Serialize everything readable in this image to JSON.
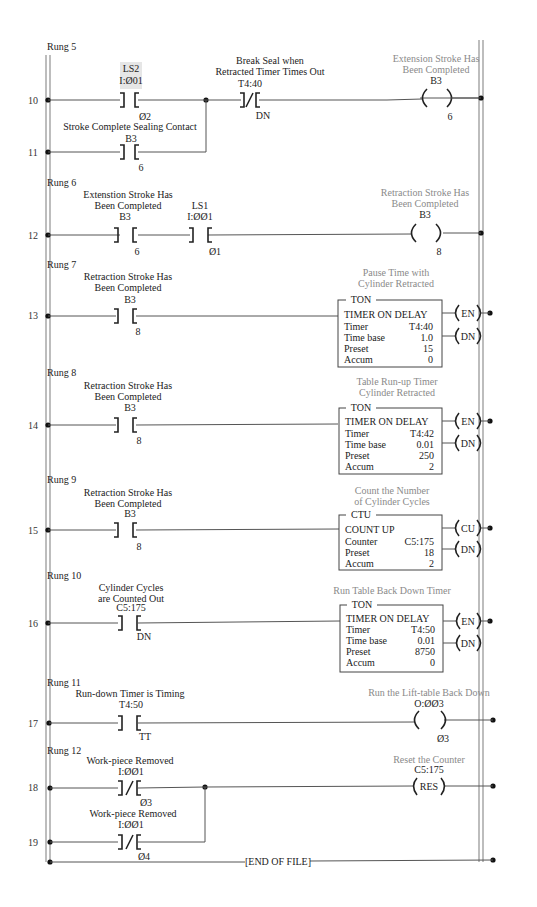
{
  "colors": {
    "line": "#555555",
    "rail": "#9a9a9a",
    "comment_gray": "#8a8a8a",
    "highlight_box": "#e6e6e6",
    "text": "#222222"
  },
  "rungs": [
    {
      "label": "Rung 5",
      "lines": [
        "10",
        "11"
      ],
      "instructions": [
        {
          "type": "XIC",
          "tag_line1": "LS2",
          "tag_line2": "I:Ø01",
          "bit": "Ø2",
          "highlighted": true
        },
        {
          "type": "XIO",
          "comment": [
            "Break Seal when",
            "Retracted Timer Times Out"
          ],
          "address": "T4:40",
          "bit": "DN"
        },
        {
          "type": "OTE",
          "comment": [
            "Extension Stroke Has",
            "Been Completed"
          ],
          "address": "B3",
          "bit": "6"
        }
      ],
      "branch": {
        "type": "XIC",
        "comment": [
          "Stroke Complete Sealing Contact"
        ],
        "address": "B3",
        "bit": "6"
      }
    },
    {
      "label": "Rung 6",
      "lines": [
        "12"
      ],
      "instructions": [
        {
          "type": "XIC",
          "comment": [
            "Extenstion Stroke Has",
            "Been Completed"
          ],
          "address": "B3",
          "bit": "6"
        },
        {
          "type": "XIC",
          "tag_line1": "LS1",
          "tag_line2": "I:ØØ1",
          "bit": "Ø1"
        },
        {
          "type": "OTE",
          "comment": [
            "Retraction Stroke Has",
            "Been Completed"
          ],
          "address": "B3",
          "bit": "8"
        }
      ]
    },
    {
      "label": "Rung 7",
      "lines": [
        "13"
      ],
      "instructions": [
        {
          "type": "XIC",
          "comment": [
            "Retraction Stroke Has",
            "Been Completed"
          ],
          "address": "B3",
          "bit": "8"
        },
        {
          "type": "TON",
          "comment": [
            "Pause Time with",
            "Cylinder Retracted"
          ],
          "block_label": "TON",
          "title": "TIMER ON DELAY",
          "rows": [
            [
              "Timer",
              "T4:40"
            ],
            [
              "Time base",
              "1.0"
            ],
            [
              "Preset",
              "15"
            ],
            [
              "Accum",
              "0"
            ]
          ],
          "outputs": [
            "EN",
            "DN"
          ]
        }
      ]
    },
    {
      "label": "Rung 8",
      "lines": [
        "14"
      ],
      "instructions": [
        {
          "type": "XIC",
          "comment": [
            "Retraction Stroke Has",
            "Been Completed"
          ],
          "address": "B3",
          "bit": "8"
        },
        {
          "type": "TON",
          "comment": [
            "Table Run-up Timer",
            "Cylinder Retracted"
          ],
          "block_label": "TON",
          "title": "TIMER ON DELAY",
          "rows": [
            [
              "Timer",
              "T4:42"
            ],
            [
              "Time base",
              "0.01"
            ],
            [
              "Preset",
              "250"
            ],
            [
              "Accum",
              "2"
            ]
          ],
          "outputs": [
            "EN",
            "DN"
          ]
        }
      ]
    },
    {
      "label": "Rung 9",
      "lines": [
        "15"
      ],
      "instructions": [
        {
          "type": "XIC",
          "comment": [
            "Retraction Stroke Has",
            "Been Completed"
          ],
          "address": "B3",
          "bit": "8"
        },
        {
          "type": "CTU",
          "comment": [
            "Count the Number",
            "of Cylinder Cycles"
          ],
          "block_label": "CTU",
          "title": "COUNT UP",
          "rows": [
            [
              "Counter",
              "C5:175"
            ],
            [
              "Preset",
              "18"
            ],
            [
              "Accum",
              "2"
            ]
          ],
          "outputs": [
            "CU",
            "DN"
          ]
        }
      ]
    },
    {
      "label": "Rung 10",
      "lines": [
        "16"
      ],
      "instructions": [
        {
          "type": "XIC",
          "comment": [
            "Cylinder Cycles",
            "are Counted Out"
          ],
          "address": "C5:175",
          "bit": "DN"
        },
        {
          "type": "TON",
          "comment": [
            "Run Table Back Down Timer"
          ],
          "block_label": "TON",
          "title": "TIMER ON DELAY",
          "rows": [
            [
              "Timer",
              "T4:50"
            ],
            [
              "Time base",
              "0.01"
            ],
            [
              "Preset",
              "8750"
            ],
            [
              "Accum",
              "0"
            ]
          ],
          "outputs": [
            "EN",
            "DN"
          ]
        }
      ]
    },
    {
      "label": "Rung 11",
      "lines": [
        "17"
      ],
      "instructions": [
        {
          "type": "XIC",
          "comment": [
            "Run-down Timer is Timing"
          ],
          "address": "T4:50",
          "bit": "TT"
        },
        {
          "type": "OTE",
          "comment": [
            "Run the Lift-table Back Down"
          ],
          "address": "O:ØØ3",
          "bit": "Ø3"
        }
      ]
    },
    {
      "label": "Rung 12",
      "lines": [
        "18",
        "19"
      ],
      "instructions": [
        {
          "type": "XIO",
          "comment": [
            "Work-piece Removed"
          ],
          "address": "I:ØØ1",
          "bit": "Ø3"
        },
        {
          "type": "RES",
          "comment": [
            "Reset the Counter"
          ],
          "address": "C5:175",
          "label": "RES"
        }
      ],
      "branch": {
        "type": "XIO",
        "comment": [
          "Work-piece Removed"
        ],
        "address": "I:ØØ1",
        "bit": "Ø4"
      }
    }
  ],
  "end_of_file": "[END OF FILE]"
}
